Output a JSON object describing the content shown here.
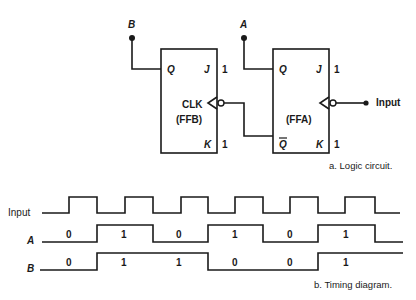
{
  "circuit": {
    "ffb": {
      "name": "(FFB)",
      "clk": "CLK",
      "q": "Q",
      "j": "J",
      "k": "K",
      "j_in": "1",
      "k_in": "1",
      "output_label": "B"
    },
    "ffa": {
      "name": "(FFA)",
      "q": "Q",
      "qbar": "Q",
      "j": "J",
      "k": "K",
      "j_in": "1",
      "k_in": "1",
      "output_label": "A",
      "clock_input_label": "Input"
    },
    "caption": "a.  Logic circuit."
  },
  "timing": {
    "signals": [
      {
        "name": "Input",
        "values": []
      },
      {
        "name": "A",
        "values": [
          "0",
          "1",
          "0",
          "1",
          "0",
          "1"
        ]
      },
      {
        "name": "B",
        "values": [
          "0",
          "1",
          "1",
          "0",
          "0",
          "1"
        ]
      }
    ],
    "caption": "b.  Timing diagram."
  }
}
